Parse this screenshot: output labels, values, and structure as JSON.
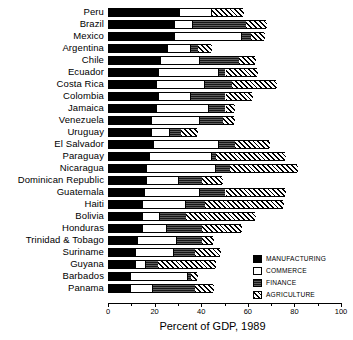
{
  "chart_data": {
    "type": "bar",
    "orientation": "horizontal",
    "stacked": true,
    "title": "",
    "xlabel": "Percent of GDP, 1989",
    "ylabel": "",
    "xlim": [
      0,
      100
    ],
    "xticks": [
      0,
      20,
      40,
      60,
      80,
      100
    ],
    "xtick_labels": [
      "0",
      "20",
      "40",
      "60",
      "80",
      "100"
    ],
    "minor_xticks": [
      10,
      30,
      50,
      70,
      90
    ],
    "grid": false,
    "legend_position": "bottom-right",
    "categories": [
      "Peru",
      "Brazil",
      "Mexico",
      "Argentina",
      "Chile",
      "Ecuador",
      "Costa Rica",
      "Colombia",
      "Jamaica",
      "Venezuela",
      "Uruguay",
      "El Salvador",
      "Paraguay",
      "Nicaragua",
      "Dominican Republic",
      "Guatemala",
      "Haiti",
      "Bolivia",
      "Honduras",
      "Trinidad & Tobago",
      "Suriname",
      "Guyana",
      "Barbados",
      "Panama"
    ],
    "series": [
      {
        "name": "MANUFACTURING",
        "color": "#000000",
        "pattern": "solid",
        "values": [
          30,
          28,
          28,
          25,
          22,
          21,
          20,
          21,
          20,
          18,
          18,
          19,
          17,
          16,
          16,
          15,
          14,
          14,
          14,
          12,
          11,
          11,
          9,
          9
        ]
      },
      {
        "name": "COMMERCE",
        "color": "#ffffff",
        "pattern": "open",
        "values": [
          14,
          8,
          29,
          10,
          17,
          26,
          21,
          14,
          23,
          21,
          8,
          28,
          27,
          30,
          14,
          24,
          19,
          8,
          11,
          17,
          17,
          5,
          25,
          10
        ]
      },
      {
        "name": "FINANCE",
        "color": "#171717",
        "pattern": "dense",
        "values": [
          0,
          23,
          4,
          3,
          17,
          3,
          12,
          15,
          7,
          10,
          5,
          7,
          2,
          6,
          10,
          11,
          8,
          11,
          15,
          11,
          9,
          5,
          1,
          18
        ]
      },
      {
        "name": "AGRICULTURE",
        "color": "#ffffff",
        "pattern": "hatch",
        "values": [
          14,
          9,
          6,
          6,
          7,
          14,
          19,
          12,
          4,
          5,
          7,
          15,
          30,
          29,
          9,
          26,
          34,
          30,
          17,
          5,
          11,
          25,
          3,
          8
        ]
      }
    ]
  },
  "legend": {
    "items": [
      {
        "label": "MANUFACTURING",
        "key": "manufacturing"
      },
      {
        "label": "COMMERCE",
        "key": "commerce"
      },
      {
        "label": "FINANCE",
        "key": "finance"
      },
      {
        "label": "AGRICULTURE",
        "key": "agriculture"
      }
    ]
  },
  "axis": {
    "title": "Percent of GDP, 1989"
  }
}
